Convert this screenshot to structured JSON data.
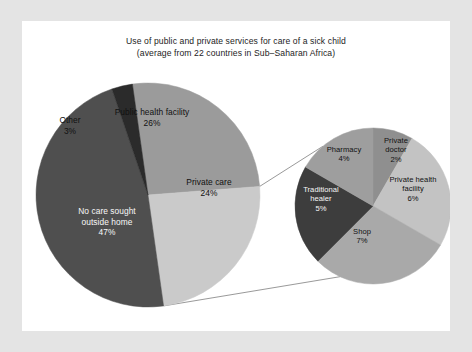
{
  "figure": {
    "frame_color": "#e4e4e4",
    "canvas_color": "#ffffff",
    "connector_color": "#8d8d8d"
  },
  "title": {
    "line1": "Use of public and private services for care of a sick child",
    "line2": "(average from 22 countries in Sub–Saharan Africa)"
  },
  "chart_data": {
    "type": "pie",
    "title": "Use of public and private services for care of a sick child (average from 22 countries in Sub–Saharan Africa)",
    "xlabel": "",
    "ylabel": "",
    "grid": false,
    "legend_position": "none",
    "units": "percent",
    "charts": [
      {
        "name": "main-pie",
        "id": "main",
        "center": [
          126,
          174
        ],
        "radius": 112,
        "start_angle_deg": -8,
        "direction": "clockwise",
        "total": 100,
        "slices": [
          {
            "label": "Public health facility",
            "value": 26,
            "pct_label": "26%",
            "color": "#9b9b9b",
            "text_color": "dark",
            "label_inside": true
          },
          {
            "label": "Private care",
            "value": 24,
            "pct_label": "24%",
            "color": "#cacaca",
            "text_color": "dark",
            "label_inside": true,
            "exploded_into": "detail-pie"
          },
          {
            "label": "No care sought outside home",
            "value": 47,
            "pct_label": "47%",
            "color": "#4f4f4f",
            "text_color": "light",
            "label_inside": true
          },
          {
            "label": "Other",
            "value": 3,
            "pct_label": "3%",
            "color": "#2b2b2b",
            "text_color": "dark",
            "label_inside": false
          }
        ]
      },
      {
        "name": "detail-pie",
        "id": "detail",
        "center": [
          351,
          185
        ],
        "radius": 78,
        "start_angle_deg": 0,
        "direction": "clockwise",
        "total": 24,
        "note": "breakdown of the 24% 'Private care' slice",
        "slices": [
          {
            "label": "Private doctor",
            "value": 2,
            "pct_label": "2%",
            "color": "#8f8f8f",
            "text_color": "dark",
            "label_inside": true
          },
          {
            "label": "Private health facility",
            "value": 6,
            "pct_label": "6%",
            "color": "#c3c3c3",
            "text_color": "dark",
            "label_inside": true
          },
          {
            "label": "Shop",
            "value": 7,
            "pct_label": "7%",
            "color": "#a9a9a9",
            "text_color": "dark",
            "label_inside": true
          },
          {
            "label": "Traditional healer",
            "value": 5,
            "pct_label": "5%",
            "color": "#3d3d3d",
            "text_color": "light",
            "label_inside": true
          },
          {
            "label": "Pharmacy",
            "value": 4,
            "pct_label": "4%",
            "color": "#9e9e9e",
            "text_color": "dark",
            "label_inside": true
          }
        ]
      }
    ]
  },
  "labels": {
    "main": {
      "public_health_facility": "Public health facility",
      "public_health_facility_pct": "26%",
      "private_care": "Private care",
      "private_care_pct": "24%",
      "no_care_line1": "No care sought",
      "no_care_line2": "outside home",
      "no_care_pct": "47%",
      "other": "Other",
      "other_pct": "3%"
    },
    "detail": {
      "pharmacy": "Pharmacy",
      "pharmacy_pct": "4%",
      "private_doctor_line1": "Private",
      "private_doctor_line2": "doctor",
      "private_doctor_pct": "2%",
      "private_health_line1": "Private health",
      "private_health_line2": "facility",
      "private_health_pct": "6%",
      "shop": "Shop",
      "shop_pct": "7%",
      "traditional_line1": "Traditional",
      "traditional_line2": "healer",
      "traditional_pct": "5%"
    }
  }
}
